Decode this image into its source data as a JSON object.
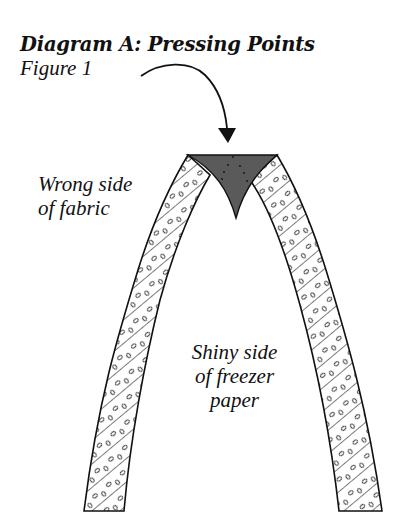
{
  "diagram": {
    "title": "Diagram A: Pressing Points",
    "subtitle": "Figure 1",
    "labels": {
      "fabric": {
        "line1": "Wrong side",
        "line2": "of fabric"
      },
      "paper": {
        "line1": "Shiny side",
        "line2": "of freezer",
        "line3": "paper"
      }
    },
    "elements": [
      {
        "name": "curved-arrow",
        "points_to": "pressing-point"
      },
      {
        "name": "pressing-point",
        "shape": "dark triangular seam allowance at apex",
        "color": "#5a5a5a"
      },
      {
        "name": "left-fabric-band",
        "pattern": "diagonal hatch with droplets"
      },
      {
        "name": "right-fabric-band",
        "pattern": "diagonal hatch with droplets"
      }
    ],
    "colors": {
      "stroke": "#111111",
      "pressing_point_fill": "#5a5a5a",
      "background": "#ffffff"
    }
  }
}
